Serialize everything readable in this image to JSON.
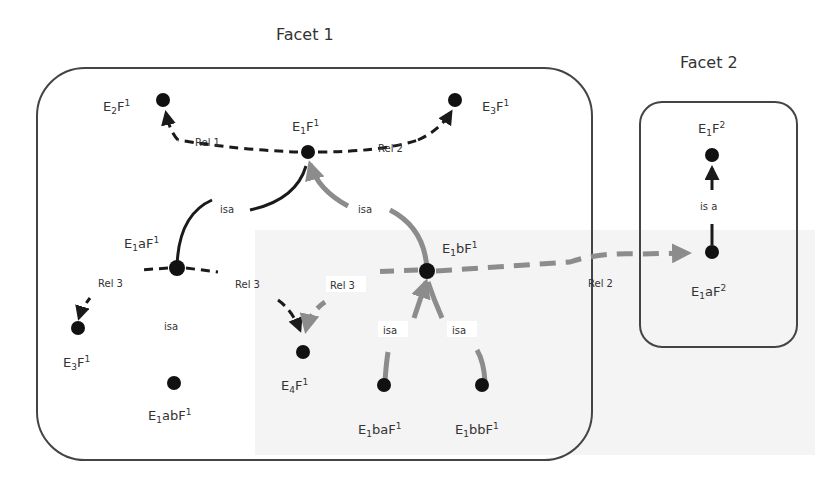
{
  "facets": [
    {
      "id": "facet1",
      "title": "Facet 1"
    },
    {
      "id": "facet2",
      "title": "Facet 2"
    }
  ],
  "nodes": [
    {
      "id": "E1F1",
      "base": "E",
      "sub": "1",
      "mid": "F",
      "sup": "1",
      "facet": "facet1"
    },
    {
      "id": "E2F1",
      "base": "E",
      "sub": "2",
      "mid": "F",
      "sup": "1",
      "facet": "facet1"
    },
    {
      "id": "E3F1_top",
      "base": "E",
      "sub": "3",
      "mid": "F",
      "sup": "1",
      "facet": "facet1"
    },
    {
      "id": "E1aF1",
      "base": "E",
      "sub": "1",
      "mid": "aF",
      "sup": "1",
      "facet": "facet1"
    },
    {
      "id": "E1bF1",
      "base": "E",
      "sub": "1",
      "mid": "bF",
      "sup": "1",
      "facet": "facet1"
    },
    {
      "id": "E3F1_left",
      "base": "E",
      "sub": "3",
      "mid": "F",
      "sup": "1",
      "facet": "facet1"
    },
    {
      "id": "E1abF1",
      "base": "E",
      "sub": "1",
      "mid": "abF",
      "sup": "1",
      "facet": "facet1"
    },
    {
      "id": "E4F1",
      "base": "E",
      "sub": "4",
      "mid": "F",
      "sup": "1",
      "facet": "facet1"
    },
    {
      "id": "E1baF1",
      "base": "E",
      "sub": "1",
      "mid": "baF",
      "sup": "1",
      "facet": "facet1"
    },
    {
      "id": "E1bbF1",
      "base": "E",
      "sub": "1",
      "mid": "bbF",
      "sup": "1",
      "facet": "facet1"
    },
    {
      "id": "E1F2",
      "base": "E",
      "sub": "1",
      "mid": "F",
      "sup": "2",
      "facet": "facet2"
    },
    {
      "id": "E1aF2",
      "base": "E",
      "sub": "1",
      "mid": "aF",
      "sup": "2",
      "facet": "facet2"
    }
  ],
  "edges": [
    {
      "from": "E1F1",
      "to": "E2F1",
      "label": "Rel 1",
      "style": "dashed",
      "color": "dark"
    },
    {
      "from": "E1F1",
      "to": "E3F1_top",
      "label": "Rel 2",
      "style": "dashed",
      "color": "dark"
    },
    {
      "from": "E1aF1",
      "to": "E1F1",
      "label": "isa",
      "style": "solid",
      "color": "dark"
    },
    {
      "from": "E1bF1",
      "to": "E1F1",
      "label": "isa",
      "style": "solid",
      "color": "gray"
    },
    {
      "from": "E1aF1",
      "to": "E3F1_left",
      "label": "Rel 3",
      "style": "dashed",
      "color": "dark"
    },
    {
      "from": "E1aF1",
      "to": "E4F1",
      "label": "Rel 3",
      "style": "dashed",
      "color": "dark"
    },
    {
      "from": "E1bF1",
      "to": "E4F1",
      "label": "Rel 3",
      "style": "dashed",
      "color": "gray"
    },
    {
      "from": "E1abF1",
      "to": "E1aF1",
      "label": "isa",
      "style": "solid",
      "color": "dark"
    },
    {
      "from": "E1baF1",
      "to": "E1bF1",
      "label": "isa",
      "style": "solid",
      "color": "gray"
    },
    {
      "from": "E1bbF1",
      "to": "E1bF1",
      "label": "isa",
      "style": "solid",
      "color": "gray"
    },
    {
      "from": "E1bF1",
      "to": "E1aF2",
      "label": "Rel 2",
      "style": "dashed",
      "color": "gray"
    },
    {
      "from": "E1aF2",
      "to": "E1F2",
      "label": "is a",
      "style": "solid",
      "color": "dark"
    }
  ],
  "colors": {
    "dark": "#1a1a1a",
    "gray": "#8c8c8c",
    "box": "#444444",
    "node": "#111111"
  }
}
